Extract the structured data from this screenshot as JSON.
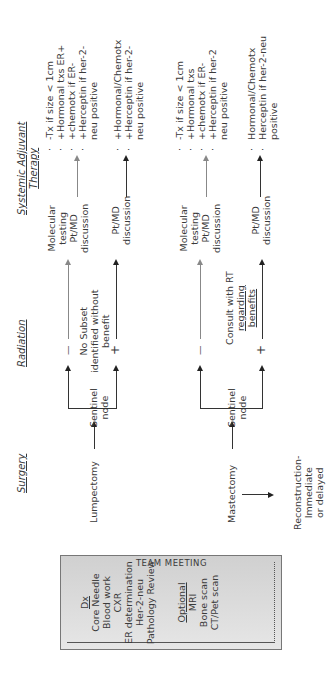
{
  "dx_box": {
    "title": "Dx",
    "items": [
      "Core Needle",
      "Blood work",
      "CXR",
      "ER determination",
      "Her-2-neu",
      "Pathology Review"
    ],
    "optional_title": "Optional",
    "optional_items": [
      "MRI",
      "Bone scan",
      "CT/Pet scan"
    ]
  },
  "team_meeting": "TEAM MEETING",
  "headers": {
    "surgery": "Surgery",
    "radiation": "Radiation",
    "systemic_line1": "Systemic Adjuvant",
    "systemic_line2": "Therapy"
  },
  "surgery": {
    "lumpectomy": "Lumpectomy",
    "mastectomy": "Mastectomy",
    "reconstruction": [
      "Reconstruction-",
      "Immediate",
      "or delayed"
    ]
  },
  "lumpectomy_branch": {
    "sentinel": [
      "Sentinel",
      "node"
    ],
    "minus": "—",
    "plus": "+",
    "radiation_note": [
      "No Subset",
      "identified without",
      "benefit"
    ],
    "minus_target": [
      "Molecular",
      "testing",
      "Pt/MD",
      "discussion"
    ],
    "plus_target": [
      "Pt/MD",
      "discussion"
    ],
    "minus_therapy": [
      "-Tx if size < 1cm",
      "+Hormonal txs ER+",
      "+chemotx if ER-",
      "+Herceptin if her-2-neu positive"
    ],
    "plus_therapy": [
      "+Hormonal/Chemotx",
      "+Herceptin if her-2-neu positive"
    ]
  },
  "mastectomy_branch": {
    "sentinel": [
      "Sentinel",
      "node"
    ],
    "minus": "—",
    "plus": "+",
    "radiation_note": [
      "Consult with RT",
      "regarding",
      "benefits"
    ],
    "minus_target": [
      "Molecular",
      "testing",
      "Pt/MD",
      "discussion"
    ],
    "plus_target": [
      "Pt/MD",
      "discussion"
    ],
    "minus_therapy": [
      "-Tx if size < 1cm",
      "+Hormonal txs",
      "+chemotx if ER-",
      "+Herceptin if her-2 neu positive"
    ],
    "plus_therapy": [
      "Hormonal/Chemotx",
      "Herceptin if her-2-neu positive"
    ]
  }
}
